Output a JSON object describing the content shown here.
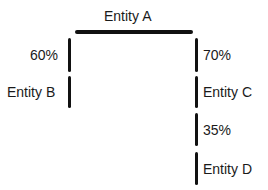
{
  "diagram": {
    "root": {
      "label": "Entity A"
    },
    "branches": [
      {
        "percent": "60%",
        "child": "Entity B",
        "side": "left"
      },
      {
        "percent": "70%",
        "child": "Entity C",
        "side": "right"
      }
    ],
    "sub_branch": {
      "from": "Entity C",
      "percent": "35%",
      "child": "Entity D"
    },
    "colors": {
      "line": "#111111",
      "text": "#1a1a1a",
      "background": "#ffffff"
    }
  }
}
